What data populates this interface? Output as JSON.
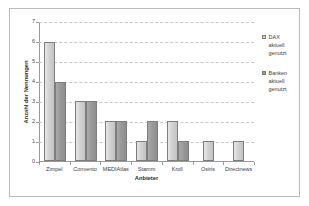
{
  "chart_data": {
    "type": "bar",
    "title": "",
    "xlabel": "Anbieter",
    "ylabel": "Anzahl der Nennungen",
    "categories": [
      "Zimpel",
      "Convento",
      "MEDIAtlas",
      "Stamm",
      "Kroll",
      "Osiris",
      "Directnews"
    ],
    "series": [
      {
        "name": "DAX aktuell genutzt",
        "values": [
          6,
          3,
          2,
          1,
          2,
          1,
          1
        ],
        "color": "#d2d2d2"
      },
      {
        "name": "Banken aktuell genutzt",
        "values": [
          4,
          3,
          2,
          2,
          1,
          0,
          0
        ],
        "color": "#9a9a9a"
      }
    ],
    "ylim": [
      0,
      7
    ],
    "yticks": [
      0,
      1,
      2,
      3,
      4,
      5,
      6,
      7
    ],
    "ytick_labels": [
      "0",
      "1",
      "2",
      "3",
      "4",
      "5",
      "6",
      "7"
    ],
    "grid": "horizontal-dashed",
    "legend_position": "right"
  },
  "legend": {
    "entries": [
      {
        "label": "DAX\naktuell\ngenutzt"
      },
      {
        "label": "Banken\naktuell\ngenutzt"
      }
    ]
  },
  "axes": {
    "x_title": "Anbieter",
    "y_title": "Anzahl der Nennungen"
  }
}
